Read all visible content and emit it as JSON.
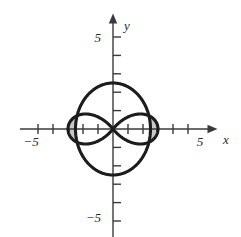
{
  "figure": {
    "title": "",
    "background_color": "#ffffff"
  },
  "axes": {
    "x_axis_name": "x",
    "y_axis_name": "y",
    "axis_color": "#3a3a3a",
    "origin_px": {
      "x": 113,
      "y": 129
    },
    "unit_px_x": 15,
    "unit_px_y": 18.4,
    "x_labels": [
      {
        "text": "−5",
        "value": -5
      },
      {
        "text": "5",
        "value": 5
      }
    ],
    "y_labels": [
      {
        "text": "5",
        "value": 5
      },
      {
        "text": "−5",
        "value": -5
      }
    ],
    "x_ticks": [
      -5,
      -4,
      -3,
      -2,
      -1,
      1,
      2,
      3,
      4,
      5
    ],
    "y_ticks": [
      -5,
      -4,
      -3,
      -2,
      -1,
      1,
      2,
      3,
      4,
      5
    ],
    "x_range": [
      -6.2,
      6.5
    ],
    "y_range": [
      -5.9,
      5.9
    ],
    "grid": false,
    "arrowheads": [
      "x-positive",
      "y-positive"
    ]
  },
  "chart_data": {
    "type": "line",
    "title": "",
    "xlabel": "x",
    "ylabel": "y",
    "xlim": [
      -6.2,
      6.5
    ],
    "ylim": [
      -5.9,
      5.9
    ],
    "grid": false,
    "legend": "none",
    "polar_curves": [
      {
        "name": "circle",
        "equation": "r = 2.5",
        "kind": "circle",
        "radius": 2.5,
        "color": "#1c1c1c",
        "linewidth": 3.1
      },
      {
        "name": "two-petal-rose",
        "equation": "r = 3 cos(2θ)",
        "kind": "rose",
        "petals": 2,
        "amplitude": 3.0,
        "color": "#1c1c1c",
        "linewidth": 3.1
      }
    ],
    "shaded_regions": [
      {
        "name": "left-lens-region",
        "description": "area inside left rose petal and outside the circle",
        "fill_color": "#c8c8c8"
      },
      {
        "name": "right-lens-region",
        "description": "area inside right rose petal and outside the circle",
        "fill_color": "#c8c8c8"
      }
    ],
    "intersections": [
      {
        "x": 0,
        "y": 0
      }
    ]
  },
  "colors": {
    "curve": "#1c1c1c",
    "axis": "#3a3a3a",
    "shade": "#c8c8c8",
    "text": "#2b2b2b"
  }
}
